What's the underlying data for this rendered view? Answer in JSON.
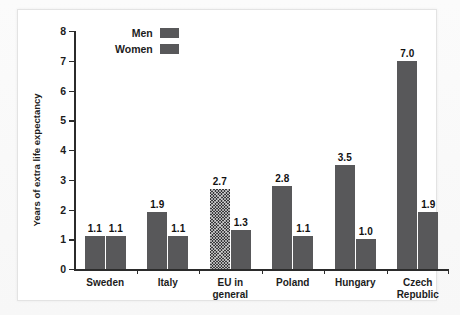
{
  "chart_data": {
    "type": "bar",
    "title": "",
    "subtitle": "",
    "xlabel": "",
    "ylabel": "Years of extra life expectancy",
    "ylim": [
      0,
      8
    ],
    "yticks": [
      0,
      1,
      2,
      3,
      4,
      5,
      6,
      7,
      8
    ],
    "ytick_labels": [
      "0",
      "1",
      "2",
      "3",
      "4",
      "5",
      "6",
      "7",
      "8"
    ],
    "grid": false,
    "legend_position": "top-left",
    "categories": [
      "Sweden",
      "Italy",
      "EU in\ngeneral",
      "Poland",
      "Hungary",
      "Czech\nRepublic"
    ],
    "series": [
      {
        "name": "Men",
        "values": [
          1.1,
          1.9,
          2.7,
          2.8,
          3.5,
          7.0
        ],
        "labels": [
          "1.1",
          "1.9",
          "2.7",
          "2.8",
          "3.5",
          "7.0"
        ],
        "color": "#58585a",
        "hatched_indices": [
          2
        ]
      },
      {
        "name": "Women",
        "values": [
          1.1,
          1.1,
          1.3,
          1.1,
          1.0,
          1.9
        ],
        "labels": [
          "1.1",
          "1.1",
          "1.3",
          "1.1",
          "1.0",
          "1.9"
        ],
        "color": "#58585a",
        "hatched_indices": []
      }
    ]
  },
  "legend": {
    "items": [
      {
        "label": "Men",
        "color": "#58585a"
      },
      {
        "label": "Women",
        "color": "#58585a"
      }
    ]
  },
  "axis": {
    "y_title": "Years of extra life expectancy",
    "y_tick_labels": [
      "8",
      "7",
      "6",
      "5",
      "4",
      "3",
      "2",
      "1",
      "0"
    ]
  },
  "category_labels": [
    "Sweden",
    "Italy",
    "EU in general",
    "Poland",
    "Hungary",
    "Czech Republic"
  ]
}
